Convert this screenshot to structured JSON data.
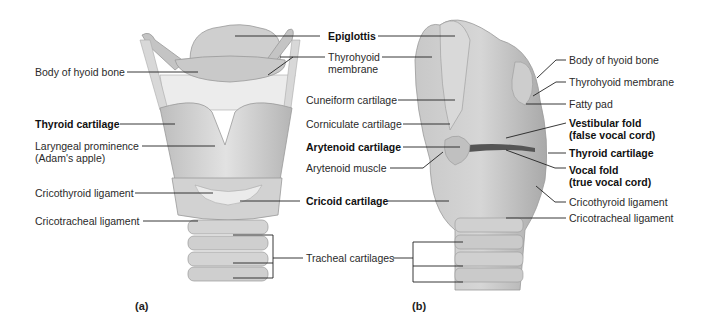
{
  "figure": {
    "panel_a": {
      "caption": "(a)",
      "labels": {
        "body_hyoid": "Body of hyoid bone",
        "thyroid_cartilage": "Thyroid cartilage",
        "laryngeal_prominence_1": "Laryngeal prominence",
        "laryngeal_prominence_2": "(Adam's apple)",
        "cricothyroid_ligament": "Cricothyroid ligament",
        "cricotracheal_ligament": "Cricotracheal ligament"
      }
    },
    "shared": {
      "epiglottis": "Epiglottis",
      "thyrohyoid_membrane_1": "Thyrohyoid",
      "thyrohyoid_membrane_2": "membrane",
      "cuneiform": "Cuneiform cartilage",
      "corniculate": "Corniculate cartilage",
      "arytenoid_cartilage": "Arytenoid cartilage",
      "arytenoid_muscle": "Arytenoid muscle",
      "cricoid_cartilage": "Cricoid cartilage",
      "tracheal_cartilages": "Tracheal cartilages"
    },
    "panel_b": {
      "caption": "(b)",
      "labels": {
        "body_hyoid": "Body of hyoid bone",
        "thyrohyoid_membrane": "Thyrohyoid membrane",
        "fatty_pad": "Fatty pad",
        "vestibular_fold_1": "Vestibular fold",
        "vestibular_fold_2": "(false vocal cord)",
        "thyroid_cartilage": "Thyroid cartilage",
        "vocal_fold_1": "Vocal fold",
        "vocal_fold_2": "(true vocal cord)",
        "cricothyroid_ligament": "Cricothyroid ligament",
        "cricotracheal_ligament": "Cricotracheal ligament"
      }
    }
  }
}
